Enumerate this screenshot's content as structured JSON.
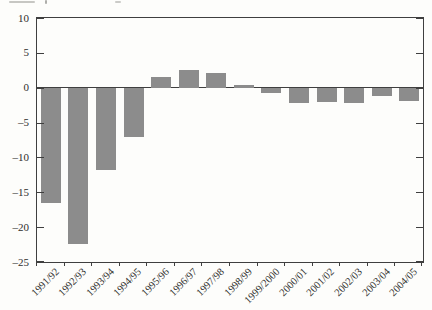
{
  "page": {
    "background": "#fdfdfb",
    "top_edge_clipped_text_present": true
  },
  "chart_data": {
    "type": "bar",
    "title": "",
    "xlabel": "",
    "ylabel": "",
    "categories": [
      "1991/92",
      "1992/93",
      "1993/94",
      "1994/95",
      "1995/96",
      "1996/97",
      "1997/98",
      "1998/99",
      "1999/2000",
      "2000/01",
      "2001/02",
      "2002/03",
      "2003/04",
      "2004/05"
    ],
    "values": [
      -16.5,
      -22.3,
      -11.8,
      -7.0,
      1.6,
      2.5,
      2.1,
      0.4,
      -0.7,
      -2.1,
      -2.0,
      -2.1,
      -1.1,
      -1.8
    ],
    "ylim": [
      -25,
      10
    ],
    "yticks": [
      10,
      5,
      0,
      -5,
      -10,
      -15,
      -20,
      -25
    ],
    "ytick_labels": [
      "10",
      "5",
      "0",
      "–5",
      "–10",
      "–15",
      "–20",
      "–25"
    ],
    "x_tick_label_rotation_deg": 45,
    "grid": false,
    "legend": "none",
    "bar_color": "#8c8c8c",
    "axis_color": "#3f3f3f",
    "text_color": "#2e2e2c"
  }
}
